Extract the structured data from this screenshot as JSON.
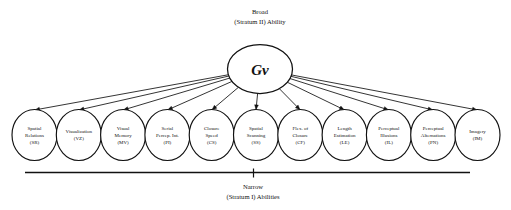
{
  "diagram": {
    "title_top": {
      "line1": "Broad",
      "line2": "(Stratum II) Ability"
    },
    "title_bottom": {
      "line1": "Narrow",
      "line2": "(Stratum I) Abilities"
    },
    "root": {
      "label": "Gv"
    },
    "nodes": [
      {
        "line1": "Spatial",
        "line2": "Relations",
        "line3": "(SR)"
      },
      {
        "line1": "Visualization",
        "line2": "",
        "line3": "(VZ)"
      },
      {
        "line1": "Visual",
        "line2": "Memory",
        "line3": "(MV)"
      },
      {
        "line1": "Serial",
        "line2": "Percep. Int.",
        "line3": "(PI)"
      },
      {
        "line1": "Closure",
        "line2": "Speed",
        "line3": "(CS)"
      },
      {
        "line1": "Spatial",
        "line2": "Scanning",
        "line3": "(SS)"
      },
      {
        "line1": "Flex. of",
        "line2": "Closure",
        "line3": "(CF)"
      },
      {
        "line1": "Length",
        "line2": "Estimation",
        "line3": "(LE)"
      },
      {
        "line1": "Perceptual",
        "line2": "Illusions",
        "line3": "(IL)"
      },
      {
        "line1": "Perceptual",
        "line2": "Alternations",
        "line3": "(PN)"
      },
      {
        "line1": "Imagery",
        "line2": "",
        "line3": "(IM)"
      }
    ],
    "colors": {
      "stroke": "#111111",
      "background": "#ffffff"
    }
  }
}
